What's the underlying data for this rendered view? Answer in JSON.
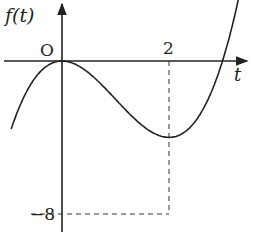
{
  "chart_data": {
    "type": "line",
    "title": "",
    "function": "f(t) = t^3 - 3t^2",
    "xlabel": "t",
    "ylabel": "f(t)",
    "origin_label": "O",
    "x_ticks": [
      {
        "value": 2,
        "label": "2"
      }
    ],
    "y_ticks": [
      {
        "value": -8,
        "label": "−8"
      }
    ],
    "points": [
      {
        "t": -0.95,
        "f": -3.57
      },
      {
        "t": -0.5,
        "f": -0.875
      },
      {
        "t": 0,
        "f": 0
      },
      {
        "t": 0.5,
        "f": -0.625
      },
      {
        "t": 1,
        "f": -2
      },
      {
        "t": 1.5,
        "f": -3.375
      },
      {
        "t": 2,
        "f": -8
      },
      {
        "t": 2.5,
        "f": -3.125
      },
      {
        "t": 3,
        "f": 0
      },
      {
        "t": 3.3,
        "f": 3.27
      }
    ],
    "key_points": [
      {
        "name": "local max",
        "t": 0,
        "f": 0
      },
      {
        "name": "local min",
        "t": 2,
        "f": -8
      },
      {
        "name": "root",
        "t": 3,
        "f": 0
      }
    ],
    "grid": false,
    "dashed_guides": [
      {
        "from": [
          2,
          0
        ],
        "to": [
          2,
          -8
        ]
      },
      {
        "from": [
          0,
          -8
        ],
        "to": [
          2,
          -8
        ]
      }
    ]
  }
}
